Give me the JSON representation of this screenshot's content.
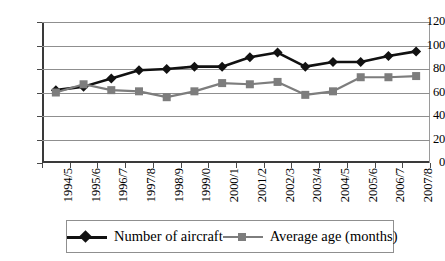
{
  "chart_data": {
    "type": "line",
    "title": "",
    "xlabel": "",
    "ylabel": "",
    "ylim": [
      0,
      120
    ],
    "ytick_step": 20,
    "yticks": [
      "0",
      "20",
      "40",
      "60",
      "80",
      "100",
      "120"
    ],
    "grid": true,
    "legend_position": "bottom",
    "categories": [
      "1994/5",
      "1995/6",
      "1996/7",
      "1997/8",
      "1998/9",
      "1999/0",
      "2000/1",
      "2001/2",
      "2002/3",
      "2003/4",
      "2004/5",
      "2005/6",
      "2006/7",
      "2007/8"
    ],
    "series": [
      {
        "name": "Number of aircraft",
        "color": "#111111",
        "marker": "diamond",
        "values": [
          62,
          65,
          72,
          79,
          80,
          82,
          82,
          90,
          94,
          82,
          86,
          86,
          91,
          95
        ]
      },
      {
        "name": "Average age (months)",
        "color": "#7d7d7d",
        "marker": "square",
        "values": [
          60,
          67,
          62,
          61,
          56,
          61,
          68,
          67,
          69,
          58,
          61,
          73,
          73,
          74
        ]
      }
    ]
  },
  "legend": {
    "entries": [
      {
        "label": "Number of aircraft"
      },
      {
        "label": "Average age (months)"
      }
    ]
  },
  "colors": {
    "aircraft_series": "#111111",
    "age_series": "#7d7d7d",
    "axis": "#3a3a3a",
    "gridline": "#8f8f8f",
    "background": "#ffffff"
  }
}
